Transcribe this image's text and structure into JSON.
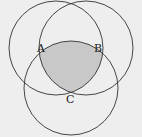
{
  "diagram": {
    "type": "venn",
    "background": "#eeeeee",
    "shade_color": "#c8c8c8",
    "stroke_color": "#333333",
    "circles": [
      {
        "name": "left",
        "cx": 56,
        "cy": 48,
        "r": 47
      },
      {
        "name": "right",
        "cx": 86,
        "cy": 48,
        "r": 47
      },
      {
        "name": "bottom",
        "cx": 71,
        "cy": 88,
        "r": 47
      }
    ],
    "labels": {
      "a": "A",
      "b": "B",
      "c": "C"
    },
    "shaded_region": "intersection of all three circles"
  }
}
